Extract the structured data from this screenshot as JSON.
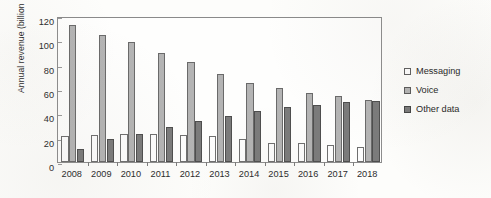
{
  "chart_data": {
    "type": "bar",
    "title": "",
    "subtitle": "",
    "xlabel": "",
    "ylabel": "Annual revenue (billion Euros)",
    "categories": [
      "2008",
      "2009",
      "2010",
      "2011",
      "2012",
      "2013",
      "2014",
      "2015",
      "2016",
      "2017",
      "2018"
    ],
    "series": [
      {
        "name": "Messaging",
        "color": "#fdfdfd",
        "values": [
          21,
          22,
          23,
          23,
          22,
          21,
          19,
          16,
          16,
          14,
          12
        ]
      },
      {
        "name": "Voice",
        "color": "#b4b4b4",
        "values": [
          113,
          104,
          99,
          90,
          82,
          72,
          65,
          61,
          57,
          54,
          51
        ]
      },
      {
        "name": "Other data",
        "color": "#7b7b7b",
        "values": [
          11,
          19,
          23,
          29,
          34,
          38,
          42,
          45,
          47,
          49,
          50
        ]
      }
    ],
    "ylim": [
      0,
      120
    ],
    "yticks": [
      0,
      20,
      40,
      60,
      80,
      100,
      120
    ],
    "ytick_labels": [
      "0",
      "20",
      "40",
      "60",
      "80",
      "100",
      "120"
    ],
    "grid": false,
    "legend_position": "right",
    "legend_entries": [
      "Messaging",
      "Voice",
      "Other data"
    ],
    "annotations": []
  },
  "legend": {
    "items": [
      {
        "label": "Messaging"
      },
      {
        "label": "Voice"
      },
      {
        "label": "Other data"
      }
    ]
  },
  "bleed_text": {
    "mark_1": "",
    "mark_2": ""
  }
}
